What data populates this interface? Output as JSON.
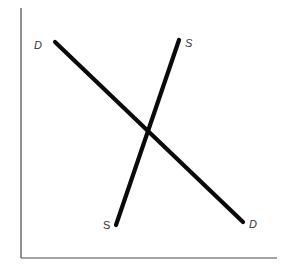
{
  "diagram": {
    "type": "supply-demand",
    "colors": {
      "background": "#ffffff",
      "axis": "#4a4a4a",
      "curve": "#0a0a0a",
      "label": "#333333"
    },
    "axes": {
      "origin": [
        21,
        258
      ],
      "y_axis_top": [
        21,
        8
      ],
      "x_axis_end": [
        277,
        258
      ]
    },
    "curves": [
      {
        "name": "demand",
        "from": [
          55,
          42
        ],
        "to": [
          243,
          222
        ],
        "label_start": "D",
        "label_end": "D"
      },
      {
        "name": "supply",
        "from": [
          179,
          40
        ],
        "to": [
          116,
          225
        ],
        "label_start": "S",
        "label_end": "S"
      }
    ],
    "equilibrium": [
      148,
      132
    ]
  },
  "labels": {
    "demand_top": "D",
    "demand_bottom": "D",
    "supply_top": "S",
    "supply_bottom": "S"
  }
}
